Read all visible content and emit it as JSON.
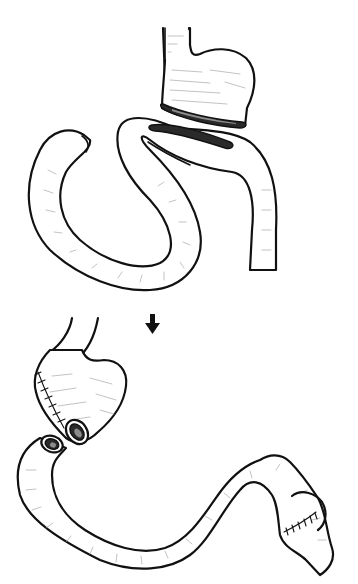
{
  "figure": {
    "colors": {
      "background": "#ffffff",
      "ink": "#111111",
      "shading": "#9a9a9a"
    },
    "panels": [
      {
        "id": "before",
        "label": "",
        "elements": [
          "esophagus",
          "stomach-pouch",
          "stomach-cut-opening",
          "small-bowel-loop",
          "bowel-cut-opening"
        ]
      },
      {
        "id": "after",
        "label": "",
        "elements": [
          "stomach-pouch-with-staple-line",
          "pouch-opening",
          "bowel-limb-opening",
          "bowel-limb",
          "side-anastomosis-suture-line"
        ]
      }
    ],
    "arrow": {
      "direction": "down",
      "icon": "arrow-down-icon"
    }
  }
}
